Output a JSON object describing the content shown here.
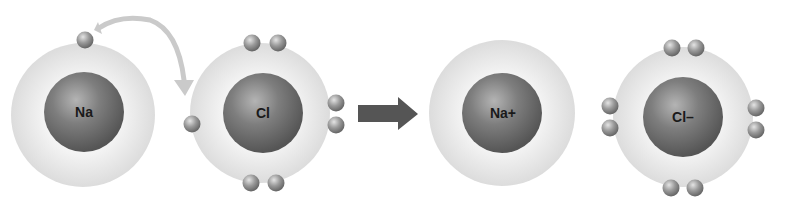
{
  "diagram": {
    "type": "ionic-bond-formation",
    "atoms": [
      {
        "label": "Na",
        "role": "sodium-atom",
        "valence_electrons": 1
      },
      {
        "label": "Cl",
        "role": "chlorine-atom",
        "valence_electrons": 7
      },
      {
        "label": "Na+",
        "role": "sodium-ion",
        "valence_electrons": 0
      },
      {
        "label": "Cl–",
        "role": "chloride-ion",
        "valence_electrons": 8
      }
    ],
    "transfer_arrow": "electron-transfer",
    "reaction_arrow": "yields",
    "colors": {
      "shell": "#e6e6e6",
      "nucleus": "#6f6f6f",
      "electron": "#8c8c8c",
      "arrow": "#555555",
      "curved_arrow": "#c8c8c8"
    }
  }
}
